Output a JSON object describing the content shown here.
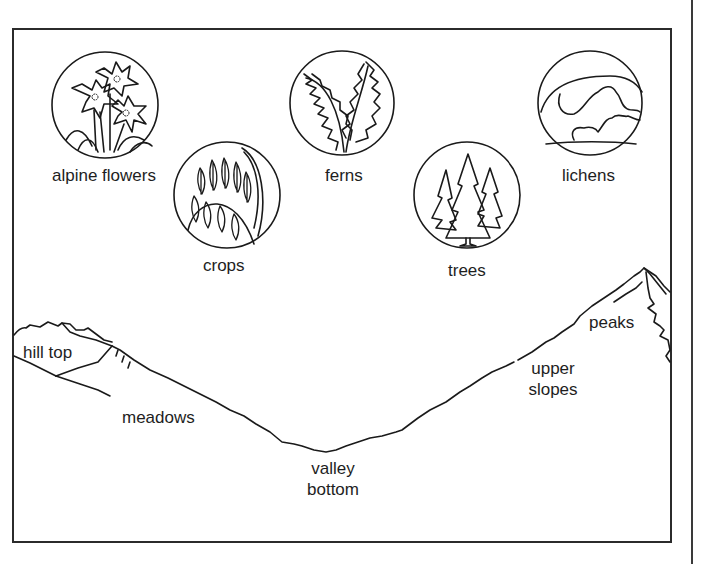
{
  "diagram": {
    "type": "habitat-zones",
    "organisms": [
      {
        "id": "alpine-flowers",
        "label": "alpine flowers",
        "icon": "alpine-flowers-icon"
      },
      {
        "id": "crops",
        "label": "crops",
        "icon": "crops-icon"
      },
      {
        "id": "ferns",
        "label": "ferns",
        "icon": "ferns-icon"
      },
      {
        "id": "trees",
        "label": "trees",
        "icon": "trees-icon"
      },
      {
        "id": "lichens",
        "label": "lichens",
        "icon": "lichens-icon"
      }
    ],
    "zones": [
      {
        "id": "hill-top",
        "label": "hill top"
      },
      {
        "id": "meadows",
        "label": "meadows"
      },
      {
        "id": "valley-bottom",
        "line1": "valley",
        "line2": "bottom"
      },
      {
        "id": "upper-slopes",
        "line1": "upper",
        "line2": "slopes"
      },
      {
        "id": "peaks",
        "label": "peaks"
      }
    ],
    "colors": {
      "line": "#1a1a1a",
      "background": "#ffffff"
    }
  }
}
